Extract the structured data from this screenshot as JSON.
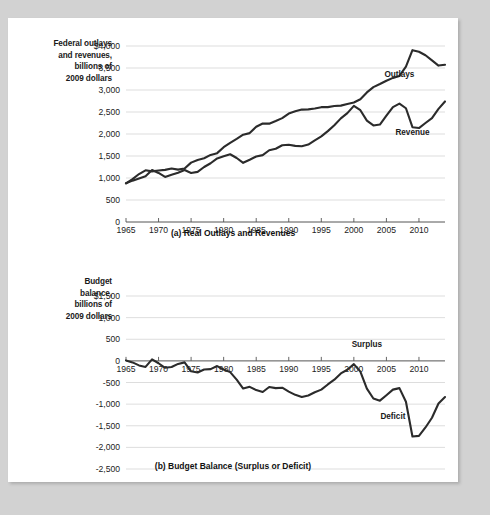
{
  "figure": {
    "background_color": "#d2d2d2",
    "page_color": "#ffffff",
    "line_color": "#2b2b2b",
    "grid_color": "#cfcfcf"
  },
  "panel_a": {
    "axis_label_lines": [
      "Federal outlays",
      "and revenues,",
      "billions of",
      "2009 dollars"
    ],
    "caption": "(a) Real Outlays and Revenues",
    "series_labels": {
      "outlays": "Outlays",
      "revenue": "Revenue"
    }
  },
  "panel_b": {
    "axis_label_lines": [
      "Budget",
      "balance,",
      "billions of",
      "2009 dollars"
    ],
    "caption": "(b) Budget Balance (Surplus or Deficit)",
    "series_labels": {
      "surplus": "Surplus",
      "deficit": "Deficit"
    }
  },
  "chart_data": [
    {
      "type": "line",
      "title": "(a) Real Outlays and Revenues",
      "xlabel": "",
      "ylabel": "Federal outlays and revenues, billions of 2009 dollars",
      "xlim": [
        1965,
        2014
      ],
      "ylim": [
        0,
        4000
      ],
      "xticks": [
        1965,
        1970,
        1975,
        1980,
        1985,
        1990,
        1995,
        2000,
        2005,
        2010
      ],
      "yticks": [
        0,
        500,
        1000,
        1500,
        2000,
        2500,
        3000,
        3500,
        4000
      ],
      "ytick_labels": [
        "0",
        "500",
        "1,000",
        "1,500",
        "2,000",
        "2,500",
        "3,000",
        "3,500",
        "$4,000"
      ],
      "grid": true,
      "legend_position": "inline-annotation",
      "x": [
        1965,
        1966,
        1967,
        1968,
        1969,
        1970,
        1971,
        1972,
        1973,
        1974,
        1975,
        1976,
        1977,
        1978,
        1979,
        1980,
        1981,
        1982,
        1983,
        1984,
        1985,
        1986,
        1987,
        1988,
        1989,
        1990,
        1991,
        1992,
        1993,
        1994,
        1995,
        1996,
        1997,
        1998,
        1999,
        2000,
        2001,
        2002,
        2003,
        2004,
        2005,
        2006,
        2007,
        2008,
        2009,
        2010,
        2011,
        2012,
        2013,
        2014
      ],
      "series": [
        {
          "name": "Outlays",
          "values": [
            880,
            975,
            1090,
            1175,
            1150,
            1170,
            1185,
            1215,
            1190,
            1215,
            1350,
            1410,
            1450,
            1525,
            1565,
            1700,
            1800,
            1890,
            1985,
            2020,
            2165,
            2240,
            2235,
            2295,
            2360,
            2465,
            2515,
            2555,
            2560,
            2580,
            2610,
            2610,
            2635,
            2645,
            2680,
            2715,
            2790,
            2945,
            3065,
            3135,
            3210,
            3275,
            3320,
            3530,
            3905,
            3870,
            3790,
            3675,
            3555,
            3575
          ]
        },
        {
          "name": "Revenue",
          "values": [
            880,
            940,
            990,
            1040,
            1180,
            1115,
            1025,
            1075,
            1120,
            1180,
            1115,
            1140,
            1250,
            1335,
            1445,
            1495,
            1540,
            1455,
            1345,
            1415,
            1490,
            1520,
            1630,
            1665,
            1745,
            1755,
            1730,
            1720,
            1760,
            1855,
            1945,
            2065,
            2200,
            2355,
            2475,
            2640,
            2540,
            2305,
            2195,
            2215,
            2415,
            2610,
            2690,
            2585,
            2155,
            2135,
            2250,
            2360,
            2570,
            2740
          ]
        }
      ],
      "annotations": [
        {
          "text": "Outlays",
          "x": 2007,
          "y": 3290
        },
        {
          "text": "Revenue",
          "x": 2009,
          "y": 1980
        }
      ]
    },
    {
      "type": "line",
      "title": "(b) Budget Balance (Surplus or Deficit)",
      "xlabel": "",
      "ylabel": "Budget balance, billions of 2009 dollars",
      "xlim": [
        1965,
        2014
      ],
      "ylim": [
        -2500,
        1500
      ],
      "xticks": [
        1965,
        1970,
        1975,
        1980,
        1985,
        1990,
        1995,
        2000,
        2005,
        2010
      ],
      "yticks": [
        -2500,
        -2000,
        -1500,
        -1000,
        -500,
        0,
        500,
        1000,
        1500
      ],
      "ytick_labels": [
        "-2,500",
        "-2,000",
        "-1,500",
        "-1,000",
        "-500",
        "0",
        "500",
        "1,000",
        "$1,500"
      ],
      "grid": true,
      "legend_position": "inline-annotation",
      "x": [
        1965,
        1966,
        1967,
        1968,
        1969,
        1970,
        1971,
        1972,
        1973,
        1974,
        1975,
        1976,
        1977,
        1978,
        1979,
        1980,
        1981,
        1982,
        1983,
        1984,
        1985,
        1986,
        1987,
        1988,
        1989,
        1990,
        1991,
        1992,
        1993,
        1994,
        1995,
        1996,
        1997,
        1998,
        1999,
        2000,
        2001,
        2002,
        2003,
        2004,
        2005,
        2006,
        2007,
        2008,
        2009,
        2010,
        2011,
        2012,
        2013,
        2014
      ],
      "series": [
        {
          "name": "Budget balance",
          "values": [
            10,
            -35,
            -105,
            -140,
            35,
            -55,
            -160,
            -140,
            -70,
            -35,
            -240,
            -270,
            -200,
            -190,
            -120,
            -200,
            -260,
            -435,
            -640,
            -600,
            -675,
            -720,
            -605,
            -630,
            -620,
            -710,
            -785,
            -835,
            -800,
            -725,
            -665,
            -545,
            -435,
            -290,
            -205,
            -75,
            -250,
            -640,
            -870,
            -920,
            -795,
            -665,
            -630,
            -945,
            -1750,
            -1735,
            -1540,
            -1315,
            -985,
            -835
          ]
        }
      ],
      "annotations": [
        {
          "text": "Surplus",
          "x": 2002,
          "y": 330
        },
        {
          "text": "Deficit",
          "x": 2006,
          "y": -1340
        }
      ]
    }
  ]
}
